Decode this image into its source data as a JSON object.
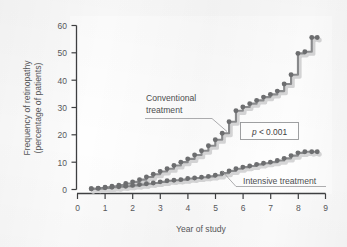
{
  "chart_data": {
    "type": "line",
    "subtype": "step",
    "title": "",
    "xlabel": "Year of study",
    "ylabel": "Frequency of retinopathy (percentage of patients)",
    "xlim": [
      0,
      9
    ],
    "ylim": [
      0,
      60
    ],
    "xticks": [
      "0",
      "1",
      "2",
      "3",
      "4",
      "5",
      "6",
      "7",
      "8",
      "9"
    ],
    "yticks": [
      "0",
      "10",
      "20",
      "30",
      "40",
      "50",
      "60"
    ],
    "grid": false,
    "legend_position": "inline-annotations",
    "annotations": [
      {
        "name": "conventional-label",
        "text_line1": "Conventional",
        "text_line2": "treatment"
      },
      {
        "name": "intensive-label",
        "text": "Intensive treatment"
      },
      {
        "name": "pvalue-box",
        "text": "p < 0.001",
        "italic_part": "p",
        "rest": " < 0.001"
      }
    ],
    "series": [
      {
        "name": "Conventional treatment",
        "color": "#6e6f71",
        "marker": "circle",
        "x": [
          0.5,
          0.75,
          1.0,
          1.25,
          1.5,
          1.75,
          2.0,
          2.25,
          2.5,
          2.75,
          3.0,
          3.25,
          3.5,
          3.75,
          4.0,
          4.25,
          4.5,
          4.75,
          5.0,
          5.25,
          5.5,
          5.75,
          6.0,
          6.25,
          6.5,
          6.75,
          7.0,
          7.25,
          7.5,
          7.75,
          8.0,
          8.25,
          8.5,
          8.7
        ],
        "values": [
          0.3,
          0.5,
          0.8,
          1.2,
          1.6,
          2.2,
          2.8,
          3.6,
          4.6,
          5.6,
          6.6,
          7.6,
          8.8,
          10.0,
          11.2,
          12.6,
          14.2,
          16.0,
          18.2,
          20.6,
          24.8,
          28.8,
          30.2,
          31.4,
          32.6,
          33.8,
          34.8,
          36.0,
          38.6,
          42.0,
          49.8,
          50.4,
          55.6,
          55.6
        ]
      },
      {
        "name": "Intensive treatment",
        "color": "#6e6f71",
        "marker": "circle",
        "x": [
          0.5,
          0.75,
          1.0,
          1.25,
          1.5,
          1.75,
          2.0,
          2.25,
          2.5,
          2.75,
          3.0,
          3.25,
          3.5,
          3.75,
          4.0,
          4.25,
          4.5,
          4.75,
          5.0,
          5.25,
          5.5,
          5.75,
          6.0,
          6.25,
          6.5,
          6.75,
          7.0,
          7.25,
          7.5,
          7.75,
          8.0,
          8.25,
          8.5,
          8.7
        ],
        "values": [
          0.3,
          0.4,
          0.6,
          0.8,
          1.0,
          1.2,
          1.5,
          1.8,
          2.1,
          2.4,
          2.8,
          3.2,
          3.4,
          3.6,
          4.0,
          4.2,
          4.5,
          4.8,
          5.2,
          6.0,
          6.8,
          7.6,
          8.2,
          8.6,
          9.2,
          9.6,
          10.0,
          10.6,
          11.4,
          12.4,
          13.4,
          13.8,
          13.8,
          13.8
        ]
      }
    ]
  },
  "axes": {
    "y_title_line1": "Frequency of retinopathy",
    "y_title_line2": "(percentage of patients)",
    "x_title": "Year of study"
  },
  "colors": {
    "marker": "#6e6f71",
    "line": "#8a8b8d",
    "shadow": "#d6d6d7",
    "axis": "#3f4042",
    "text": "#58595b",
    "background": "#fbfbfb",
    "panel": "#ffffff"
  }
}
